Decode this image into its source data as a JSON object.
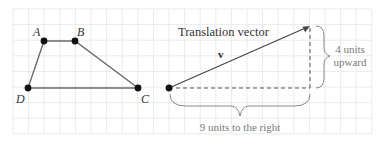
{
  "colors": {
    "background": "#ffffff",
    "grid": "#e6e6e6",
    "line": "#6b6b6b",
    "point": "#111111",
    "text": "#333333",
    "muted_text": "#7a7a7a"
  },
  "grid": {
    "x0": 13,
    "y0": 9,
    "step": 15.6,
    "cols": 23,
    "rows": 8
  },
  "quadrilateral": {
    "vertices": [
      {
        "label": "A",
        "x": 44,
        "y": 41,
        "lx": 33,
        "ly": 36
      },
      {
        "label": "B",
        "x": 75,
        "y": 41,
        "lx": 77,
        "ly": 36
      },
      {
        "label": "C",
        "x": 138,
        "y": 88,
        "lx": 141,
        "ly": 103
      },
      {
        "label": "D",
        "x": 28,
        "y": 88,
        "lx": 16,
        "ly": 103
      }
    ]
  },
  "vector": {
    "title": "Translation vector",
    "label": "v",
    "start": {
      "x": 169,
      "y": 88
    },
    "end": {
      "x": 310,
      "y": 26
    },
    "horizontal_label": "9 units to the right",
    "vertical_label_line1": "4 units",
    "vertical_label_line2": "upward"
  }
}
